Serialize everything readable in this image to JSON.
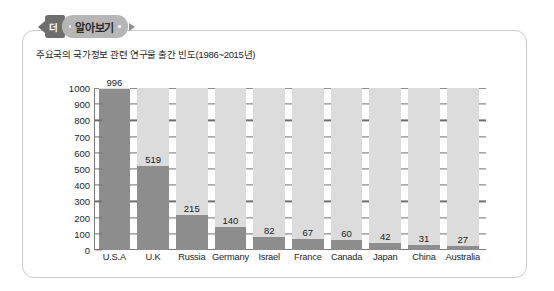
{
  "badge": {
    "tab_label": "더",
    "main_label": "알아보기"
  },
  "subtitle": "주요국의 국가정보 관련 연구물 출간 빈도(1986~2015년)",
  "colors": {
    "bar": "#8d8d8d",
    "band": "#dcdcdc",
    "axis": "#7a7a7a",
    "badge_dark": "#6e6e6e",
    "badge_light": "#b6b6b6",
    "panel_border": "#c9c9c9"
  },
  "chart_data": {
    "type": "bar",
    "title": "주요국의 국가정보 관련 연구물 출간 빈도(1986~2015년)",
    "xlabel": "",
    "ylabel": "",
    "ylim": [
      0,
      1000
    ],
    "yticks": [
      0,
      100,
      200,
      300,
      400,
      500,
      600,
      700,
      800,
      900,
      1000
    ],
    "grid": false,
    "legend": "none",
    "categories": [
      "U.S.A",
      "U.K",
      "Russia",
      "Germany",
      "Israel",
      "France",
      "Canada",
      "Japan",
      "China",
      "Australia"
    ],
    "values": [
      996,
      519,
      215,
      140,
      82,
      67,
      60,
      42,
      31,
      27
    ]
  }
}
